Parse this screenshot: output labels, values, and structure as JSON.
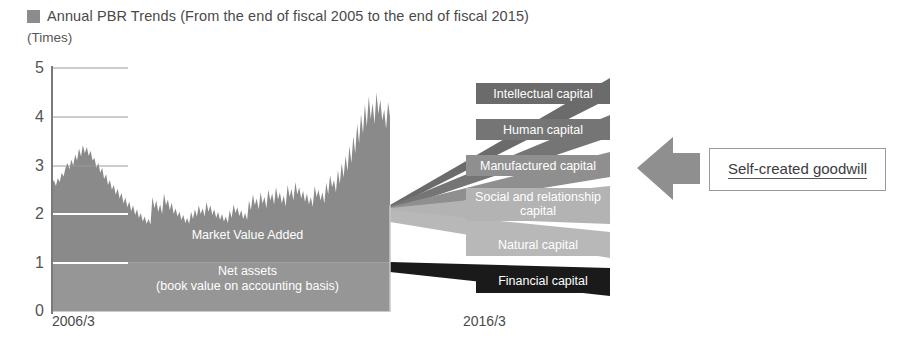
{
  "header": {
    "marker_icon": "square-marker-icon",
    "title": "Annual PBR Trends (From the end of fiscal 2005 to the end of fiscal 2015)",
    "unit_label": "(Times)"
  },
  "callout": {
    "text": "Self-created goodwill",
    "arrow_icon": "left-arrow-icon"
  },
  "chart_data": {
    "type": "area",
    "title": "Annual PBR Trends (From the end of fiscal 2005 to the end of fiscal 2015)",
    "xlabel": "",
    "ylabel": "(Times)",
    "ylim": [
      0,
      5
    ],
    "yticks": [
      0,
      1,
      2,
      3,
      4,
      5
    ],
    "ytick_labels": [
      "0",
      "1",
      "2",
      "3",
      "4",
      "5"
    ],
    "xticks": [
      "2006/3",
      "2016/3"
    ],
    "grid": true,
    "gridline_values": [
      1,
      2,
      3,
      4
    ],
    "legend_position": "in-chart",
    "bands": [
      {
        "name": "Net assets (book value on accounting basis)",
        "label": "Net assets",
        "sublabel": "(book value on accounting basis)",
        "from": 0,
        "to": 1,
        "color": "#969696"
      },
      {
        "name": "Market Value Added",
        "label": "Market Value Added",
        "from": 1,
        "to": "pbr_series",
        "color": "#8a8a8a"
      }
    ],
    "series": [
      {
        "name": "PBR",
        "values": [
          2.62,
          2.7,
          2.58,
          2.74,
          2.66,
          2.85,
          2.77,
          2.95,
          3.05,
          2.92,
          3.12,
          3.0,
          3.22,
          3.1,
          3.35,
          3.18,
          3.42,
          3.25,
          3.38,
          3.2,
          3.3,
          3.1,
          3.15,
          2.95,
          3.05,
          2.85,
          2.95,
          2.72,
          2.82,
          2.6,
          2.7,
          2.5,
          2.6,
          2.4,
          2.52,
          2.32,
          2.44,
          2.22,
          2.34,
          2.14,
          2.26,
          2.06,
          2.18,
          1.98,
          2.1,
          1.92,
          2.02,
          1.85,
          1.95,
          1.8,
          1.9,
          1.78,
          2.35,
          2.12,
          2.28,
          2.05,
          2.2,
          2.0,
          2.42,
          2.18,
          2.3,
          2.08,
          2.24,
          2.0,
          2.12,
          1.95,
          2.05,
          1.88,
          1.98,
          1.82,
          1.92,
          1.8,
          2.05,
          1.9,
          2.1,
          1.95,
          2.18,
          2.0,
          2.12,
          1.95,
          2.25,
          2.05,
          2.18,
          1.98,
          2.1,
          1.92,
          2.05,
          1.88,
          2.0,
          1.85,
          1.95,
          1.82,
          2.08,
          1.92,
          2.2,
          2.02,
          2.14,
          1.96,
          2.08,
          1.9,
          2.02,
          1.88,
          2.28,
          2.08,
          2.4,
          2.18,
          2.32,
          2.1,
          2.45,
          2.22,
          2.35,
          2.12,
          2.5,
          2.28,
          2.42,
          2.2,
          2.55,
          2.3,
          2.45,
          2.22,
          2.38,
          2.15,
          2.6,
          2.35,
          2.52,
          2.28,
          2.66,
          2.4,
          2.55,
          2.32,
          2.48,
          2.25,
          2.42,
          2.2,
          2.35,
          2.15,
          2.58,
          2.35,
          2.5,
          2.28,
          2.45,
          2.22,
          2.65,
          2.4,
          2.8,
          2.55,
          2.7,
          2.45,
          2.9,
          2.62,
          3.05,
          2.75,
          3.2,
          2.88,
          3.4,
          3.05,
          3.6,
          3.25,
          3.85,
          3.45,
          4.05,
          3.65,
          4.25,
          3.8,
          4.42,
          3.95,
          4.28,
          3.85,
          4.5,
          4.05,
          4.35,
          3.92,
          4.15,
          3.75,
          4.3,
          4.0
        ]
      }
    ],
    "capital_labels": [
      {
        "name": "Intellectual capital",
        "color": "#6b6b6b",
        "text_color": "#ffffff"
      },
      {
        "name": "Human capital",
        "color": "#757575",
        "text_color": "#ffffff"
      },
      {
        "name": "Manufactured capital",
        "color": "#8f8f8f",
        "text_color": "#ffffff"
      },
      {
        "name": "Social and relationship capital",
        "color": "#b3b3b3",
        "text_color": "#ffffff"
      },
      {
        "name": "Natural capital",
        "color": "#b8b8b8",
        "text_color": "#ffffff"
      },
      {
        "name": "Financial capital",
        "color": "#1a1a1a",
        "text_color": "#ffffff"
      }
    ]
  }
}
